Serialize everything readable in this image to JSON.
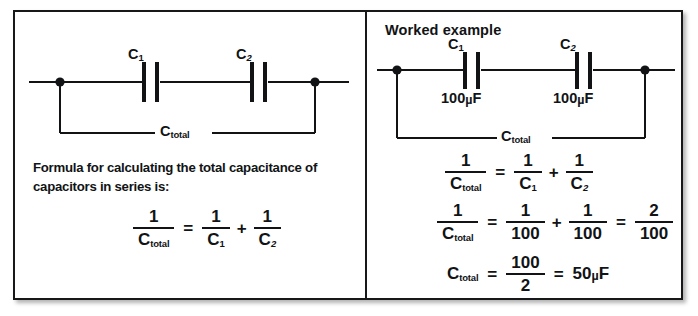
{
  "figure": {
    "panels": {
      "left": {
        "circuit": {
          "cap1_label": "C",
          "cap1_sub": "1",
          "cap2_label": "C",
          "cap2_sub": "2",
          "total_label": "C",
          "total_sub": "total"
        },
        "description_line1": "Formula for calculating the total capacitance of",
        "description_line2": "capacitors in series is:",
        "formula": {
          "lhs_num": "1",
          "lhs_den_sym": "C",
          "lhs_den_sub": "total",
          "equals": "=",
          "t1_num": "1",
          "t1_den_sym": "C",
          "t1_den_sub": "1",
          "plus": "+",
          "t2_num": "1",
          "t2_den_sym": "C",
          "t2_den_sub": "2"
        }
      },
      "right": {
        "title": "Worked example",
        "circuit": {
          "cap1_label": "C",
          "cap1_sub": "1",
          "cap1_value": "100",
          "cap1_unit_mu": "µ",
          "cap1_unit_f": "F",
          "cap2_label": "C",
          "cap2_sub": "2",
          "cap2_value": "100",
          "cap2_unit_mu": "µ",
          "cap2_unit_f": "F",
          "total_label": "C",
          "total_sub": "total"
        },
        "equations": {
          "row1": {
            "lhs_num": "1",
            "lhs_den_sym": "C",
            "lhs_den_sub": "total",
            "equals": "=",
            "t1_num": "1",
            "t1_den_sym": "C",
            "t1_den_sub": "1",
            "plus": "+",
            "t2_num": "1",
            "t2_den_sym": "C",
            "t2_den_sub": "2"
          },
          "row2": {
            "lhs_num": "1",
            "lhs_den_sym": "C",
            "lhs_den_sub": "total",
            "equals1": "=",
            "t1_num": "1",
            "t1_den": "100",
            "plus": "+",
            "t2_num": "1",
            "t2_den": "100",
            "equals2": "=",
            "t3_num": "2",
            "t3_den": "100"
          },
          "row3": {
            "lhs_sym": "C",
            "lhs_sub": "total",
            "equals1": "=",
            "frac_num": "100",
            "frac_den": "2",
            "equals2": "=",
            "result_value": "50",
            "result_mu": "µ",
            "result_f": "F"
          }
        }
      }
    }
  },
  "colors": {
    "ink": "#111315",
    "frame": "#16181a",
    "paper": "#ffffff"
  }
}
